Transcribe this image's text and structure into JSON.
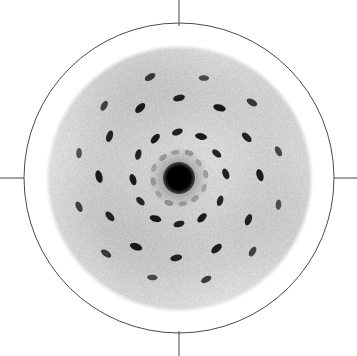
{
  "figure": {
    "kind": "electron-diffraction-pattern",
    "width": 357,
    "height": 356,
    "background_color": "#ffffff"
  },
  "colors": {
    "background": "#ffffff",
    "outline_circle": "#4a4a4a",
    "tick_mark": "#555555",
    "detector_disc": "#d2d2d2",
    "detector_disc_inner": "#cfcfcf",
    "spot": "#111111",
    "beam_stop": "#000000",
    "halo": "#3a3a3a"
  },
  "geometry": {
    "center_x": 179,
    "center_y": 178,
    "outline_circle_radius": 155,
    "outline_circle_stroke_width": 1,
    "detector_disc_radius": 131,
    "beam_stop_radius": 16,
    "halo_radius": 30,
    "noise_amount": 14
  },
  "ticks": [
    {
      "name": "tick-north",
      "orientation": "vertical",
      "x1": 179,
      "y1": 0,
      "x2": 179,
      "y2": 26
    },
    {
      "name": "tick-south",
      "orientation": "vertical",
      "x1": 179,
      "y1": 331,
      "x2": 179,
      "y2": 356
    },
    {
      "name": "tick-west",
      "orientation": "horizontal",
      "x1": 0,
      "y1": 178,
      "x2": 24,
      "y2": 178
    },
    {
      "name": "tick-east",
      "orientation": "horizontal",
      "x1": 334,
      "y1": 178,
      "x2": 357,
      "y2": 178
    }
  ],
  "chart_data": {
    "type": "scatter",
    "subtitle": "",
    "xlabel": "",
    "ylabel": "",
    "grid": false,
    "legend": "none",
    "coordinate_system": "polar-pixel",
    "center": [
      179,
      178
    ],
    "xlim": [
      0,
      357
    ],
    "ylim": [
      0,
      356
    ],
    "rings": [
      {
        "name": "ring-1-faint",
        "radius": 26,
        "count": 12,
        "intensity": "faint",
        "opacity": 0.3,
        "rx": 4.5,
        "ry": 2.6,
        "spots": [
          {
            "angle": 8,
            "radius": 27,
            "rx": 4.2,
            "ry": 2.4,
            "rot": 100,
            "opacity": 0.26
          },
          {
            "angle": 38,
            "radius": 25,
            "rx": 4.0,
            "ry": 2.4,
            "rot": 130,
            "opacity": 0.22
          },
          {
            "angle": 68,
            "radius": 27,
            "rx": 4.6,
            "ry": 2.6,
            "rot": 160,
            "opacity": 0.3
          },
          {
            "angle": 98,
            "radius": 26,
            "rx": 4.2,
            "ry": 2.4,
            "rot": 10,
            "opacity": 0.24
          },
          {
            "angle": 128,
            "radius": 26,
            "rx": 4.4,
            "ry": 2.5,
            "rot": 40,
            "opacity": 0.28
          },
          {
            "angle": 158,
            "radius": 27,
            "rx": 4.2,
            "ry": 2.4,
            "rot": 70,
            "opacity": 0.22
          },
          {
            "angle": 188,
            "radius": 26,
            "rx": 4.4,
            "ry": 2.5,
            "rot": 100,
            "opacity": 0.26
          },
          {
            "angle": 218,
            "radius": 26,
            "rx": 4.0,
            "ry": 2.3,
            "rot": 130,
            "opacity": 0.2
          },
          {
            "angle": 248,
            "radius": 27,
            "rx": 4.6,
            "ry": 2.6,
            "rot": 160,
            "opacity": 0.3
          },
          {
            "angle": 278,
            "radius": 26,
            "rx": 4.2,
            "ry": 2.4,
            "rot": 10,
            "opacity": 0.24
          },
          {
            "angle": 308,
            "radius": 26,
            "rx": 4.4,
            "ry": 2.5,
            "rot": 40,
            "opacity": 0.26
          },
          {
            "angle": 338,
            "radius": 27,
            "rx": 4.2,
            "ry": 2.4,
            "rot": 70,
            "opacity": 0.22
          }
        ]
      },
      {
        "name": "ring-2-strong",
        "radius": 46,
        "count": 12,
        "intensity": "strong",
        "opacity": 0.95,
        "rx": 5.6,
        "ry": 3.1,
        "spots": [
          {
            "angle": 5,
            "radius": 47,
            "rx": 5.6,
            "ry": 3.2,
            "rot": 112,
            "opacity": 0.93
          },
          {
            "angle": 33,
            "radius": 45,
            "rx": 5.4,
            "ry": 3.0,
            "rot": 140,
            "opacity": 0.9
          },
          {
            "angle": 62,
            "radius": 47,
            "rx": 6.0,
            "ry": 3.2,
            "rot": 168,
            "opacity": 0.96
          },
          {
            "angle": 92,
            "radius": 46,
            "rx": 5.6,
            "ry": 3.1,
            "rot": 20,
            "opacity": 0.92
          },
          {
            "angle": 121,
            "radius": 46,
            "rx": 5.8,
            "ry": 3.2,
            "rot": 48,
            "opacity": 0.95
          },
          {
            "angle": 150,
            "radius": 47,
            "rx": 5.4,
            "ry": 3.0,
            "rot": 76,
            "opacity": 0.9
          },
          {
            "angle": 182,
            "radius": 46,
            "rx": 5.8,
            "ry": 3.2,
            "rot": 108,
            "opacity": 0.94
          },
          {
            "angle": 211,
            "radius": 45,
            "rx": 5.2,
            "ry": 3.0,
            "rot": 136,
            "opacity": 0.88
          },
          {
            "angle": 240,
            "radius": 47,
            "rx": 6.0,
            "ry": 3.2,
            "rot": 164,
            "opacity": 0.96
          },
          {
            "angle": 270,
            "radius": 46,
            "rx": 5.6,
            "ry": 3.1,
            "rot": 16,
            "opacity": 0.92
          },
          {
            "angle": 300,
            "radius": 46,
            "rx": 5.8,
            "ry": 3.2,
            "rot": 44,
            "opacity": 0.94
          },
          {
            "angle": 331,
            "radius": 47,
            "rx": 5.4,
            "ry": 3.0,
            "rot": 72,
            "opacity": 0.9
          }
        ]
      },
      {
        "name": "ring-3-strong",
        "radius": 80,
        "count": 12,
        "intensity": "strong",
        "opacity": 0.95,
        "rx": 6.2,
        "ry": 3.3,
        "spots": [
          {
            "angle": 2,
            "radius": 81,
            "rx": 6.2,
            "ry": 3.4,
            "rot": 106,
            "opacity": 0.94
          },
          {
            "angle": 31,
            "radius": 79,
            "rx": 6.0,
            "ry": 3.2,
            "rot": 136,
            "opacity": 0.92
          },
          {
            "angle": 60,
            "radius": 81,
            "rx": 6.4,
            "ry": 3.4,
            "rot": 164,
            "opacity": 0.96
          },
          {
            "angle": 90,
            "radius": 80,
            "rx": 6.0,
            "ry": 3.2,
            "rot": 14,
            "opacity": 0.92
          },
          {
            "angle": 119,
            "radius": 80,
            "rx": 6.2,
            "ry": 3.4,
            "rot": 44,
            "opacity": 0.95
          },
          {
            "angle": 149,
            "radius": 81,
            "rx": 6.0,
            "ry": 3.2,
            "rot": 72,
            "opacity": 0.9
          },
          {
            "angle": 179,
            "radius": 80,
            "rx": 6.4,
            "ry": 3.4,
            "rot": 104,
            "opacity": 0.95
          },
          {
            "angle": 209,
            "radius": 79,
            "rx": 5.8,
            "ry": 3.2,
            "rot": 132,
            "opacity": 0.9
          },
          {
            "angle": 238,
            "radius": 81,
            "rx": 6.4,
            "ry": 3.4,
            "rot": 160,
            "opacity": 0.96
          },
          {
            "angle": 268,
            "radius": 80,
            "rx": 6.0,
            "ry": 3.2,
            "rot": 12,
            "opacity": 0.92
          },
          {
            "angle": 298,
            "radius": 80,
            "rx": 6.2,
            "ry": 3.4,
            "rot": 40,
            "opacity": 0.94
          },
          {
            "angle": 329,
            "radius": 81,
            "rx": 6.0,
            "ry": 3.2,
            "rot": 68,
            "opacity": 0.91
          }
        ]
      },
      {
        "name": "ring-4-outer",
        "radius": 104,
        "count": 12,
        "intensity": "medium",
        "opacity": 0.78,
        "rx": 5.6,
        "ry": 3.0,
        "spots": [
          {
            "angle": 15,
            "radius": 103,
            "rx": 5.4,
            "ry": 3.0,
            "rot": 118,
            "opacity": 0.72
          },
          {
            "angle": 46,
            "radius": 105,
            "rx": 5.8,
            "ry": 3.1,
            "rot": 150,
            "opacity": 0.8
          },
          {
            "angle": 76,
            "radius": 103,
            "rx": 5.2,
            "ry": 2.8,
            "rot": 178,
            "opacity": 0.7
          },
          {
            "angle": 106,
            "radius": 105,
            "rx": 5.8,
            "ry": 3.1,
            "rot": 30,
            "opacity": 0.8
          },
          {
            "angle": 136,
            "radius": 104,
            "rx": 5.4,
            "ry": 3.0,
            "rot": 60,
            "opacity": 0.74
          },
          {
            "angle": 166,
            "radius": 103,
            "rx": 5.2,
            "ry": 2.8,
            "rot": 88,
            "opacity": 0.68
          },
          {
            "angle": 196,
            "radius": 104,
            "rx": 5.6,
            "ry": 3.0,
            "rot": 116,
            "opacity": 0.76
          },
          {
            "angle": 226,
            "radius": 105,
            "rx": 5.8,
            "ry": 3.1,
            "rot": 146,
            "opacity": 0.8
          },
          {
            "angle": 255,
            "radius": 103,
            "rx": 5.2,
            "ry": 2.8,
            "rot": 176,
            "opacity": 0.7
          },
          {
            "angle": 285,
            "radius": 105,
            "rx": 5.6,
            "ry": 3.0,
            "rot": 28,
            "opacity": 0.78
          },
          {
            "angle": 315,
            "radius": 104,
            "rx": 5.4,
            "ry": 3.0,
            "rot": 58,
            "opacity": 0.74
          },
          {
            "angle": 345,
            "radius": 103,
            "rx": 5.2,
            "ry": 2.8,
            "rot": 86,
            "opacity": 0.68
          }
        ]
      }
    ]
  }
}
